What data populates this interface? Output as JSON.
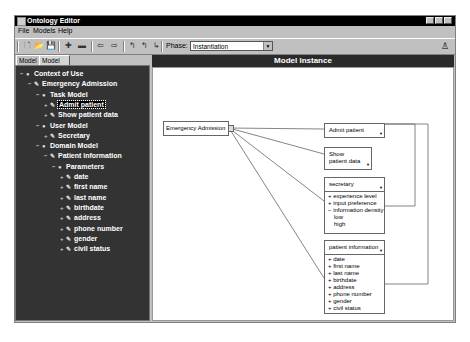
{
  "window": {
    "title": "Ontology Editor",
    "controls": [
      "minimize",
      "maximize",
      "close"
    ]
  },
  "menubar": {
    "items": [
      {
        "label": "File"
      },
      {
        "label": "Models"
      },
      {
        "label": "Help"
      }
    ]
  },
  "toolbar": {
    "buttons": [
      {
        "icon": "new-file-icon",
        "glyph": "🗋"
      },
      {
        "icon": "open-folder-icon",
        "glyph": "📂"
      },
      {
        "icon": "save-icon",
        "glyph": "💾"
      },
      {
        "icon": "add-icon",
        "glyph": "✚"
      },
      {
        "icon": "remove-icon",
        "glyph": "▬"
      },
      {
        "icon": "arrow-left-icon",
        "glyph": "⇦"
      },
      {
        "icon": "arrow-right-icon",
        "glyph": "⇨"
      },
      {
        "icon": "link-icon-1",
        "glyph": "↰"
      },
      {
        "icon": "link-icon-2",
        "glyph": "↰"
      },
      {
        "icon": "link-icon-3",
        "glyph": "↳"
      }
    ],
    "phase_label": "Phase:",
    "phase_value": "Instantiation",
    "help_glyph": "♙"
  },
  "tabs": [
    {
      "label": "Model",
      "active": false
    },
    {
      "label": "Model Instance",
      "active": true
    }
  ],
  "tree": {
    "nodes": [
      {
        "label": "Context of Use",
        "level": 0,
        "toggle": "−",
        "icon": "globe"
      },
      {
        "label": "Emergency Admission",
        "level": 1,
        "toggle": "−",
        "icon": "pen"
      },
      {
        "label": "Task Model",
        "level": 2,
        "toggle": "−",
        "icon": "globe"
      },
      {
        "label": "Admit patient",
        "level": 3,
        "toggle": "+",
        "icon": "pen",
        "selected": true
      },
      {
        "label": "Show patient data",
        "level": 3,
        "toggle": "+",
        "icon": "pen"
      },
      {
        "label": "User Model",
        "level": 2,
        "toggle": "−",
        "icon": "globe"
      },
      {
        "label": "Secretary",
        "level": 3,
        "toggle": "+",
        "icon": "pen"
      },
      {
        "label": "Domain Model",
        "level": 2,
        "toggle": "−",
        "icon": "globe"
      },
      {
        "label": "Patient information",
        "level": 3,
        "toggle": "−",
        "icon": "pen"
      },
      {
        "label": "Parameters",
        "level": 4,
        "toggle": "−",
        "icon": "globe"
      },
      {
        "label": "date",
        "level": 5,
        "toggle": "+",
        "icon": "pen"
      },
      {
        "label": "first name",
        "level": 5,
        "toggle": "+",
        "icon": "pen"
      },
      {
        "label": "last name",
        "level": 5,
        "toggle": "+",
        "icon": "pen"
      },
      {
        "label": "birthdate",
        "level": 5,
        "toggle": "+",
        "icon": "pen"
      },
      {
        "label": "address",
        "level": 5,
        "toggle": "+",
        "icon": "pen"
      },
      {
        "label": "phone number",
        "level": 5,
        "toggle": "+",
        "icon": "pen"
      },
      {
        "label": "gender",
        "level": 5,
        "toggle": "+",
        "icon": "pen"
      },
      {
        "label": "civil status",
        "level": 5,
        "toggle": "+",
        "icon": "pen"
      }
    ]
  },
  "model_instance": {
    "header": "Model Instance",
    "root_node": "Emergency Admission",
    "boxes": [
      {
        "id": "admit",
        "title": "Admit patient",
        "attributes": []
      },
      {
        "id": "show",
        "title": "Show\npatient data",
        "attributes": []
      },
      {
        "id": "secretary",
        "title": "secretary",
        "attributes": [
          {
            "text": "+ experience level"
          },
          {
            "text": "+ input preference"
          },
          {
            "text": "− information density"
          },
          {
            "text": "low",
            "sub": true
          },
          {
            "text": "high",
            "sub": true
          }
        ]
      },
      {
        "id": "patient",
        "title": "patient information",
        "attributes": [
          {
            "text": "+ date"
          },
          {
            "text": "+ first name"
          },
          {
            "text": "+ last name"
          },
          {
            "text": "+ birthdate"
          },
          {
            "text": "+ address"
          },
          {
            "text": "+ phone number"
          },
          {
            "text": "+ gender"
          },
          {
            "text": "+ civil status"
          }
        ]
      }
    ]
  },
  "colors": {
    "titlebar": "#000000",
    "chrome": "#c0c0c0",
    "tree_bg": "#333333",
    "canvas_bg": "#ffffff",
    "header_bg": "#2a2a2a"
  }
}
